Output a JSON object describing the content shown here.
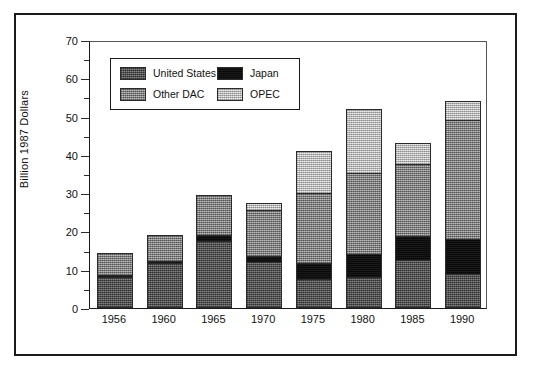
{
  "chart_data": {
    "type": "bar",
    "subtype": "stacked-vertical",
    "title": "",
    "subtitle": "",
    "xlabel": "",
    "ylabel": "Billion 1987 Dollars",
    "categories": [
      "1956",
      "1960",
      "1965",
      "1970",
      "1975",
      "1980",
      "1985",
      "1990"
    ],
    "series": [
      {
        "name": "United States",
        "color": "#5c5c5c",
        "values": [
          8.2,
          11.8,
          17.5,
          12.0,
          7.5,
          8.2,
          12.5,
          9.0
        ]
      },
      {
        "name": "Japan",
        "color": "#0d0d0d",
        "values": [
          0.3,
          0.6,
          1.5,
          1.5,
          4.3,
          5.8,
          6.3,
          9.0
        ]
      },
      {
        "name": "Other DAC",
        "color": "#8d8d8d",
        "values": [
          6.0,
          6.6,
          10.5,
          12.0,
          18.2,
          21.3,
          18.8,
          31.0
        ]
      },
      {
        "name": "OPEC",
        "color": "#c6c6c6",
        "values": [
          0.0,
          0.0,
          0.0,
          2.0,
          11.0,
          16.7,
          5.4,
          5.0
        ]
      }
    ],
    "totals": [
      14.5,
      19.0,
      29.5,
      27.5,
      41.0,
      52.0,
      43.0,
      54.0
    ],
    "ylim": [
      0,
      70
    ],
    "y_major_ticks": [
      0,
      10,
      20,
      30,
      40,
      50,
      60,
      70
    ],
    "y_minor_ticks": [
      5,
      15,
      25,
      35,
      45,
      55,
      65
    ],
    "y_tick_labels": [
      "0",
      "10",
      "20",
      "30",
      "40",
      "50",
      "60",
      "70"
    ],
    "grid": false,
    "legend_position": "upper-left-inside",
    "legend_entries": [
      "United States",
      "Japan",
      "Other DAC",
      "OPEC"
    ]
  },
  "axes": {
    "y_title": "Billion 1987 Dollars"
  },
  "legend": {
    "items": [
      {
        "label": "United States",
        "swatch": "fill-us"
      },
      {
        "label": "Japan",
        "swatch": "fill-japan"
      },
      {
        "label": "Other DAC",
        "swatch": "fill-dac"
      },
      {
        "label": "OPEC",
        "swatch": "fill-opec"
      }
    ]
  }
}
